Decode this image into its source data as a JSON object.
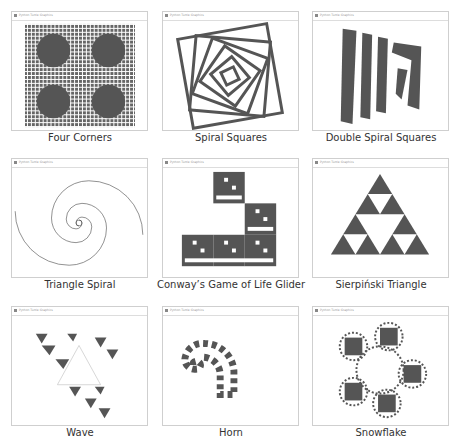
{
  "gallery": {
    "items": [
      {
        "caption": "Four Corners",
        "window_title": "Python Turtle Graphics"
      },
      {
        "caption": "Spiral Squares",
        "window_title": "Python Turtle Graphics"
      },
      {
        "caption": "Double Spiral Squares",
        "window_title": "Python Turtle Graphics"
      },
      {
        "caption": "Triangle Spiral",
        "window_title": "Python Turtle Graphics"
      },
      {
        "caption": "Conway’s Game of Life Glider",
        "window_title": "Python Turtle Graphics"
      },
      {
        "caption": "Sierpiński Triangle",
        "window_title": "Python Turtle Graphics"
      },
      {
        "caption": "Wave",
        "window_title": "Python Turtle Graphics"
      },
      {
        "caption": "Horn",
        "window_title": "Python Turtle Graphics"
      },
      {
        "caption": "Snowflake",
        "window_title": "Python Turtle Graphics"
      }
    ]
  },
  "colors": {
    "fill": "#555555",
    "frame": "#cfcfcf",
    "caption": "#333333"
  }
}
